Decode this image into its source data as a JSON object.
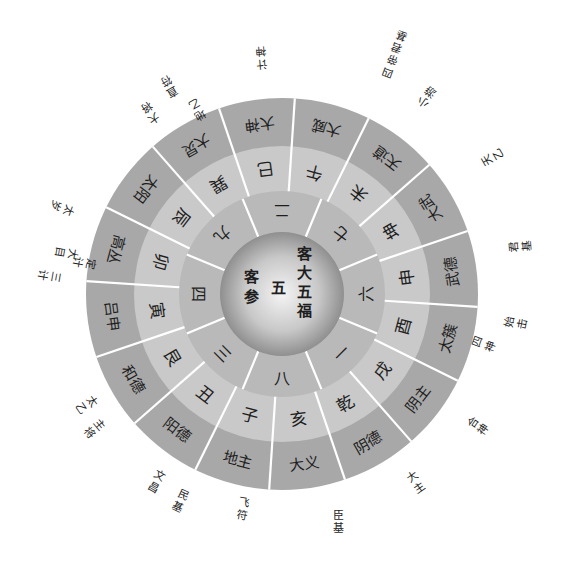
{
  "diagram": {
    "center": {
      "x": 282,
      "y": 294
    },
    "colors": {
      "outer_ring": "#a8a8a8",
      "middle_ring": "#c9c9c9",
      "inner_ring": "#b9b9b9",
      "core_light": "#efefef",
      "core_dark": "#8f8f8f",
      "divider": "#ffffff",
      "text": "#1e1e1e"
    },
    "core": {
      "lines": [
        {
          "text": "客大五福",
          "note": "right column"
        },
        {
          "text": "五",
          "note": "center"
        },
        {
          "text": "客参",
          "note": "left column"
        }
      ],
      "right_column": [
        "客",
        "大",
        "五",
        "福"
      ],
      "center": "五",
      "left_column": [
        "客",
        "参"
      ]
    },
    "inner_ring_numbers": [
      {
        "label": "二",
        "angle": -90
      },
      {
        "label": "七",
        "angle": -45
      },
      {
        "label": "六",
        "angle": 0
      },
      {
        "label": "一",
        "angle": 45
      },
      {
        "label": "八",
        "angle": 90
      },
      {
        "label": "三",
        "angle": 135
      },
      {
        "label": "四",
        "angle": 180
      },
      {
        "label": "九",
        "angle": -135
      }
    ],
    "middle_ring_palaces": [
      {
        "label": "午",
        "angle": -75
      },
      {
        "label": "未",
        "angle": -52.5
      },
      {
        "label": "坤",
        "angle": -30
      },
      {
        "label": "申",
        "angle": -7.5
      },
      {
        "label": "酉",
        "angle": 15
      },
      {
        "label": "戌",
        "angle": 37.5
      },
      {
        "label": "乾",
        "angle": 60
      },
      {
        "label": "亥",
        "angle": 82.5
      },
      {
        "label": "子",
        "angle": 105
      },
      {
        "label": "丑",
        "angle": 127.5
      },
      {
        "label": "艮",
        "angle": 150
      },
      {
        "label": "寅",
        "angle": 172.5
      },
      {
        "label": "卯",
        "angle": 195
      },
      {
        "label": "辰",
        "angle": 217.5
      },
      {
        "label": "巽",
        "angle": 240
      },
      {
        "label": "巳",
        "angle": 262.5
      }
    ],
    "outer_ring_spirits": [
      {
        "label": "大威",
        "angle": -75
      },
      {
        "label": "天道",
        "angle": -52.5
      },
      {
        "label": "大武",
        "angle": -30
      },
      {
        "label": "武德",
        "angle": -7.5
      },
      {
        "label": "太簇",
        "angle": 15
      },
      {
        "label": "阴主",
        "angle": 37.5
      },
      {
        "label": "阴德",
        "angle": 60
      },
      {
        "label": "大义",
        "angle": 82.5
      },
      {
        "label": "地主",
        "angle": 105
      },
      {
        "label": "阳德",
        "angle": 127.5
      },
      {
        "label": "和德",
        "angle": 150
      },
      {
        "label": "吕申",
        "angle": 172.5
      },
      {
        "label": "高丛",
        "angle": 195
      },
      {
        "label": "太阳",
        "angle": 217.5
      },
      {
        "label": "大炅",
        "angle": 240
      },
      {
        "label": "大神",
        "angle": 262.5
      }
    ],
    "outside_labels": [
      {
        "text": "四\n帝\n君\n基",
        "lines": [
          "四",
          "帝",
          "君",
          "基"
        ],
        "x": 388,
        "y": 72,
        "rot": -160
      },
      {
        "text": "小\n游",
        "lines": [
          "小",
          "游"
        ],
        "x": 423,
        "y": 102,
        "rot": -145
      },
      {
        "text": "天\n乙",
        "lines": [
          "天",
          "乙"
        ],
        "x": 487,
        "y": 160,
        "rot": -120
      },
      {
        "text": "君\n基",
        "lines": [
          "君",
          "基"
        ],
        "x": 514,
        "y": 247,
        "rot": -95
      },
      {
        "text": "始\n击",
        "lines": [
          "始",
          "击"
        ],
        "x": 510,
        "y": 322,
        "rot": -80
      },
      {
        "text": "四\n神",
        "lines": [
          "四",
          "神"
        ],
        "x": 478,
        "y": 342,
        "rot": -70
      },
      {
        "text": "合\n神",
        "lines": [
          "合",
          "神"
        ],
        "x": 473,
        "y": 422,
        "rot": -55
      },
      {
        "text": "大\n主",
        "lines": [
          "大",
          "主"
        ],
        "x": 412,
        "y": 477,
        "rot": -35
      },
      {
        "text": "臣\n基",
        "lines": [
          "臣",
          "基"
        ],
        "x": 338,
        "y": 515,
        "rot": 0
      },
      {
        "text": "飞\n符",
        "lines": [
          "飞",
          "符"
        ],
        "x": 244,
        "y": 503,
        "rot": 10
      },
      {
        "text": "民\n基",
        "lines": [
          "民",
          "基"
        ],
        "x": 183,
        "y": 495,
        "rot": 25
      },
      {
        "text": "文\n昌",
        "lines": [
          "文",
          "昌"
        ],
        "x": 160,
        "y": 476,
        "rot": 30
      },
      {
        "text": "主\n将",
        "lines": [
          "主",
          "将"
        ],
        "x": 99,
        "y": 425,
        "rot": 50
      },
      {
        "text": "太\n乙",
        "lines": [
          "太",
          "乙"
        ],
        "x": 92,
        "y": 401,
        "rot": 55
      },
      {
        "text": "定\n计",
        "lines": [
          "定",
          "计"
        ],
        "x": 90,
        "y": 264,
        "rot": 100
      },
      {
        "text": "大\n目",
        "lines": [
          "大",
          "目"
        ],
        "x": 72,
        "y": 254,
        "rot": 100
      },
      {
        "text": "三\n计",
        "lines": [
          "三",
          "计"
        ],
        "x": 55,
        "y": 277,
        "rot": 100
      },
      {
        "text": "太\n岁",
        "lines": [
          "太",
          "岁"
        ],
        "x": 68,
        "y": 210,
        "rot": 110
      },
      {
        "text": "地\n乙",
        "lines": [
          "地",
          "乙"
        ],
        "x": 200,
        "y": 115,
        "rot": 150
      },
      {
        "text": "直\n符",
        "lines": [
          "直",
          "符"
        ],
        "x": 172,
        "y": 92,
        "rot": 150
      },
      {
        "text": "大\n将",
        "lines": [
          "大",
          "将"
        ],
        "x": 154,
        "y": 118,
        "rot": 145
      },
      {
        "text": "计\n神",
        "lines": [
          "计",
          "神"
        ],
        "x": 262,
        "y": 64,
        "rot": 175
      }
    ]
  }
}
